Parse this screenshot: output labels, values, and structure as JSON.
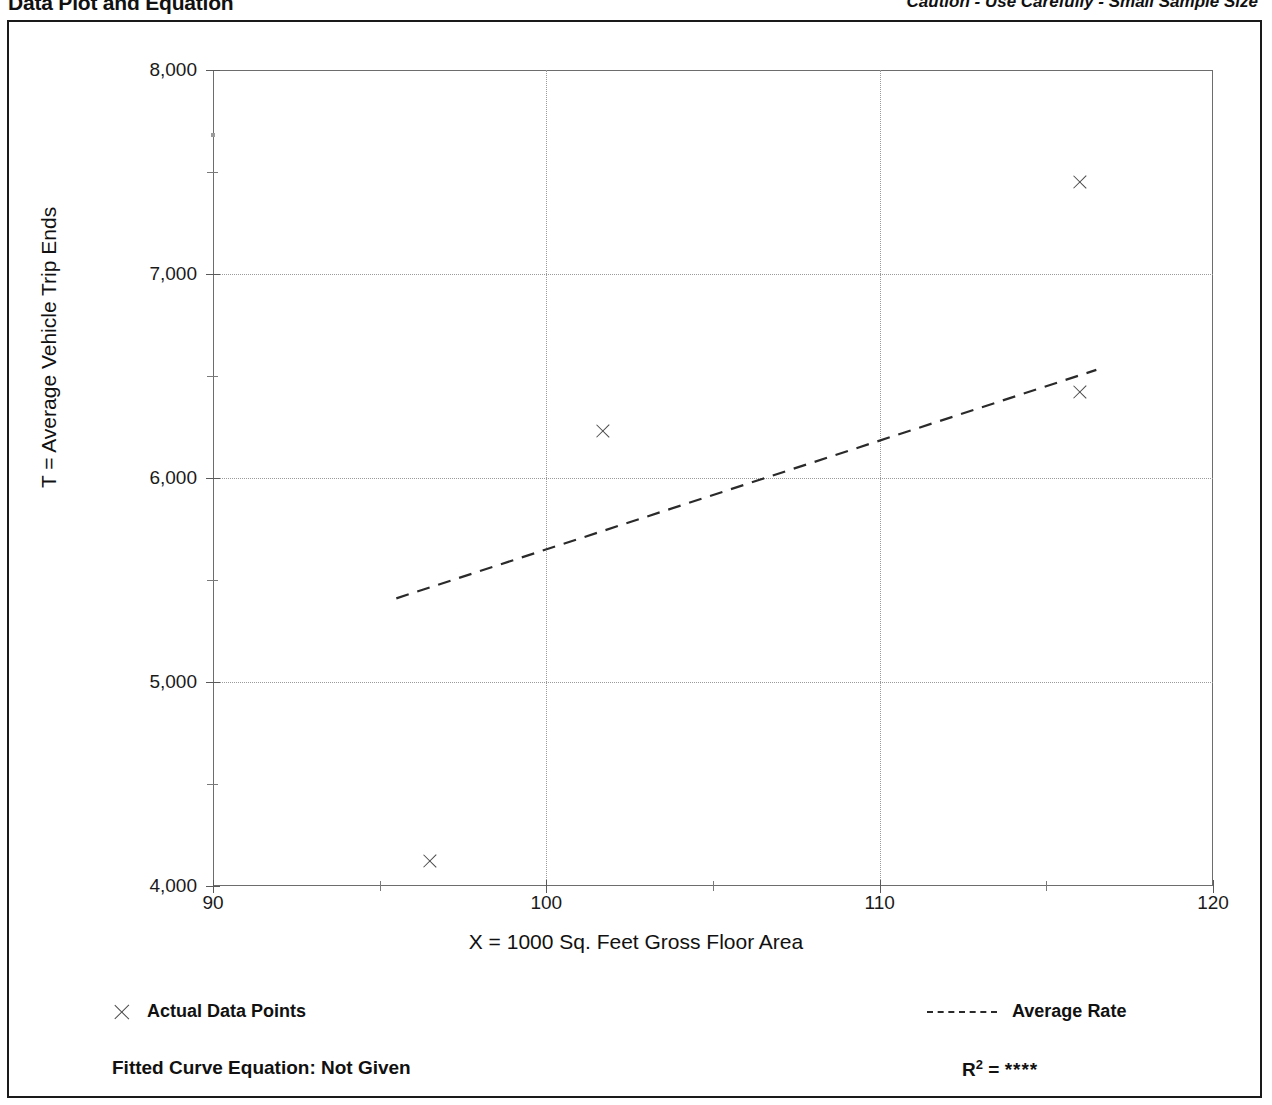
{
  "header": {
    "title": "Data Plot and Equation",
    "caution": "Caution - Use Carefully - Small Sample Size"
  },
  "legend": {
    "points_label": "Actual Data Points",
    "line_label": "Average Rate",
    "points_marker_icon": "x-marker-icon",
    "line_marker_icon": "dashed-line-icon"
  },
  "footer": {
    "equation_label": "Fitted Curve Equation:  Not Given",
    "r2_prefix": "R",
    "r2_exponent": "2",
    "r2_equals": " = ",
    "r2_value": "****"
  },
  "colors": {
    "frame": "#1a1a1a",
    "axis": "#5a5a5a",
    "grid": "#9a9a9a",
    "marker": "#4a4a4a",
    "trend": "#2a2a2a",
    "text": "#111111",
    "background": "#ffffff"
  },
  "chart_data": {
    "type": "scatter",
    "title": "Data Plot and Equation",
    "xlabel": "X = 1000 Sq. Feet Gross Floor Area",
    "ylabel": "T = Average Vehicle Trip Ends",
    "xlim": [
      90,
      120
    ],
    "ylim": [
      4000,
      8000
    ],
    "xticks": [
      90,
      100,
      110,
      120
    ],
    "xtick_labels": [
      "90",
      "100",
      "110",
      "120"
    ],
    "xticks_minor": [
      95,
      105,
      115
    ],
    "yticks": [
      4000,
      5000,
      6000,
      7000,
      8000
    ],
    "ytick_labels": [
      "4,000",
      "5,000",
      "6,000",
      "7,000",
      "8,000"
    ],
    "yticks_minor": [
      4500,
      5500,
      6500,
      7500
    ],
    "grid": true,
    "grid_style": "dotted",
    "legend_position": "below-plot",
    "series": [
      {
        "name": "Actual Data Points",
        "type": "scatter",
        "marker": "x",
        "points": [
          {
            "x": 96.5,
            "y": 4125
          },
          {
            "x": 101.7,
            "y": 6230
          },
          {
            "x": 116.0,
            "y": 7450
          },
          {
            "x": 116.0,
            "y": 6420
          }
        ]
      },
      {
        "name": "Average Rate",
        "type": "line",
        "style": "dashed",
        "points": [
          {
            "x": 95.5,
            "y": 5410
          },
          {
            "x": 116.5,
            "y": 6530
          }
        ]
      }
    ],
    "annotations": [
      {
        "name": "stray-speck",
        "x": 90.0,
        "y": 7680
      }
    ],
    "fitted_curve_equation": "Not Given",
    "r_squared": "****"
  }
}
